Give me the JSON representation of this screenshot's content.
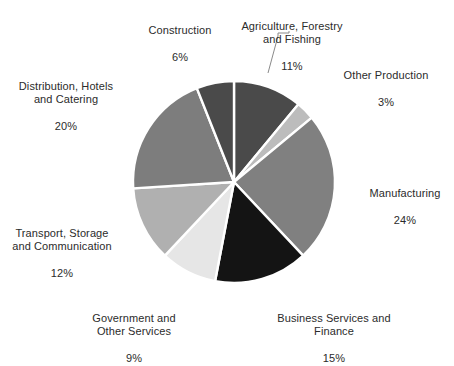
{
  "chart_data": {
    "type": "pie",
    "title": "",
    "subtitle": "",
    "xlabel": "",
    "ylabel": "",
    "legend_position": "none",
    "grid": false,
    "labels_show_percent": true,
    "start_angle_deg": 0,
    "direction": "clockwise",
    "categories": [
      "Agriculture, Forestry and Fishing",
      "Other Production",
      "Manufacturing",
      "Business Services and Finance",
      "Government and Other Services",
      "Transport, Storage and Communication",
      "Distribution, Hotels and Catering",
      "Construction"
    ],
    "values": [
      11,
      3,
      24,
      15,
      9,
      12,
      20,
      6
    ],
    "value_labels": [
      "11%",
      "3%",
      "24%",
      "15%",
      "9%",
      "12%",
      "20%",
      "6%"
    ],
    "colors": [
      "#4a4a4a",
      "#bcbcbc",
      "#808080",
      "#141414",
      "#e6e6e6",
      "#b0b0b0",
      "#7d7d7d",
      "#4a4a4a"
    ],
    "slice_separator_color": "#ffffff",
    "background_color": "#ffffff",
    "text_color": "#2b2b2b"
  },
  "labels": {
    "agriculture": {
      "name": "Agriculture, Forestry\nand Fishing",
      "percent": "11%"
    },
    "other_production": {
      "name": "Other Production",
      "percent": "3%"
    },
    "manufacturing": {
      "name": "Manufacturing",
      "percent": "24%"
    },
    "business_services": {
      "name": "Business Services and\nFinance",
      "percent": "15%"
    },
    "government": {
      "name": "Government and\nOther Services",
      "percent": "9%"
    },
    "transport": {
      "name": "Transport, Storage\nand Communication",
      "percent": "12%"
    },
    "distribution": {
      "name": "Distribution, Hotels\nand Catering",
      "percent": "20%"
    },
    "construction": {
      "name": "Construction",
      "percent": "6%"
    }
  }
}
